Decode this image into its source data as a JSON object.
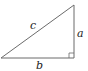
{
  "diagram": {
    "type": "right-triangle",
    "labels": {
      "hypotenuse": "c",
      "vertical_leg": "a",
      "horizontal_leg": "b"
    },
    "right_angle_marker": true,
    "colors": {
      "stroke": "#6b6b6b",
      "text": "#222222",
      "background": "#ffffff"
    }
  }
}
